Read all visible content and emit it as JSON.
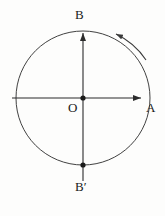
{
  "figure": {
    "background_color": "#fdfdfc",
    "stroke_color": "#2b2b2b",
    "labels": {
      "top": "B",
      "bottom": "B′",
      "right": "A",
      "center": "O"
    },
    "geometry": {
      "center_x": 83,
      "center_y": 98,
      "radius": 67,
      "h_axis_start_x": 12,
      "h_axis_end_x": 143,
      "v_axis_top_y": 31,
      "v_axis_bottom_y": 181
    },
    "points": [
      {
        "name": "center-point-O",
        "x": 83,
        "y": 98
      },
      {
        "name": "top-point-B",
        "x": 83,
        "y": 31
      },
      {
        "name": "bottom-point-B-prime",
        "x": 83,
        "y": 165
      }
    ],
    "rotation_arrow": {
      "name": "counterclockwise-rotation-arrow",
      "direction": "counterclockwise"
    }
  }
}
